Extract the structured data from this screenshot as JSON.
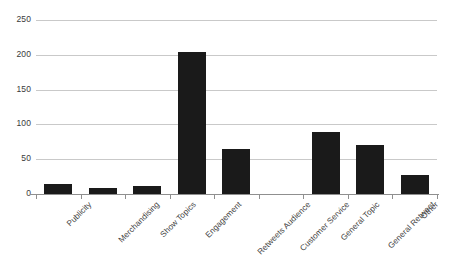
{
  "chart_data": {
    "type": "bar",
    "title": "",
    "subtitle": "",
    "xlabel": "",
    "ylabel": "",
    "categories": [
      "Publicity",
      "Merchandising",
      "Show Topics",
      "Engagement",
      "Retweets Audience",
      "Customer Service",
      "General Topic",
      "General Retweet",
      "Other"
    ],
    "values": [
      15,
      9,
      12,
      204,
      65,
      0,
      89,
      71,
      28
    ],
    "ylim": [
      0,
      250
    ],
    "yticks": [
      0,
      50,
      100,
      150,
      200,
      250
    ],
    "ytick_labels": [
      "0",
      "50",
      "100",
      "150",
      "200",
      "250"
    ],
    "grid": true,
    "legend": false,
    "bar_color": "#1a1a1a",
    "gridline_color": "#c9c9c9",
    "axis_color": "#8f8f8f",
    "background_color": "#ffffff",
    "xtick_label_rotation": -45
  }
}
